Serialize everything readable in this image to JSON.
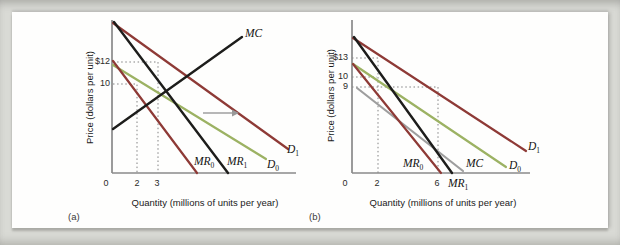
{
  "colors": {
    "maroon": "#8e3a36",
    "green": "#9cb263",
    "black": "#1d1d1b",
    "gray": "#9e9e9e",
    "axis": "#8a8a8a",
    "dotted": "#828282",
    "arrow": "#999999",
    "background": "#d9dad5",
    "card": "#fefefd"
  },
  "panels": [
    {
      "id": "a",
      "tag": "(a)",
      "ylabel": "Price (dollars per unit)",
      "xlabel": "Quantity (millions of units per year)",
      "yticks": [
        {
          "label": "$12"
        },
        {
          "label": "10"
        }
      ],
      "xticks": [
        {
          "label": "0"
        },
        {
          "label": "2"
        },
        {
          "label": "3"
        }
      ],
      "curve_labels": [
        {
          "base": "MC",
          "sub": ""
        },
        {
          "base": "MR",
          "sub": "0"
        },
        {
          "base": "MR",
          "sub": "1"
        },
        {
          "base": "D",
          "sub": "0"
        },
        {
          "base": "D",
          "sub": "1"
        }
      ],
      "geometry": {
        "y_axis": [
          112,
          20,
          112,
          173
        ],
        "x_axis": [
          112,
          173,
          296,
          173
        ],
        "curves": [
          {
            "name": "D0",
            "color": "green",
            "w": 2.2,
            "x1": 113,
            "y1": 65,
            "x2": 266,
            "y2": 159
          },
          {
            "name": "MR0",
            "color": "maroon",
            "w": 2.2,
            "x1": 113,
            "y1": 61,
            "x2": 197,
            "y2": 173
          },
          {
            "name": "D1",
            "color": "maroon",
            "w": 2.2,
            "x1": 113,
            "y1": 23,
            "x2": 288,
            "y2": 149
          },
          {
            "name": "MC",
            "color": "black",
            "w": 2.4,
            "x1": 113,
            "y1": 129,
            "x2": 242,
            "y2": 37
          },
          {
            "name": "MR1",
            "color": "black",
            "w": 2.4,
            "x1": 114,
            "y1": 22,
            "x2": 228,
            "y2": 173
          }
        ],
        "dotted": [
          {
            "name": "price-12-quantity-3",
            "pts": [
              [
                113,
                62
              ],
              [
                158,
                62
              ],
              [
                158,
                173
              ]
            ]
          },
          {
            "name": "price-10-quantity-2",
            "pts": [
              [
                113,
                84
              ],
              [
                137,
                84
              ],
              [
                137,
                173
              ]
            ]
          }
        ],
        "arrow": {
          "x1": 203,
          "y1": 113,
          "x2": 239,
          "y2": 113
        }
      }
    },
    {
      "id": "b",
      "tag": "(b)",
      "ylabel": "Price (dollars per unit)",
      "xlabel": "Quantity (millions of units per year)",
      "yticks": [
        {
          "label": "$13"
        },
        {
          "label": "10"
        },
        {
          "label": "9"
        }
      ],
      "xticks": [
        {
          "label": "0"
        },
        {
          "label": "2"
        },
        {
          "label": "6"
        }
      ],
      "curve_labels": [
        {
          "base": "MR",
          "sub": "0"
        },
        {
          "base": "MC",
          "sub": ""
        },
        {
          "base": "MR",
          "sub": "1"
        },
        {
          "base": "D",
          "sub": "0"
        },
        {
          "base": "D",
          "sub": "1"
        }
      ],
      "geometry": {
        "y_axis": [
          352,
          20,
          352,
          173
        ],
        "x_axis": [
          352,
          173,
          530,
          173
        ],
        "curves": [
          {
            "name": "MC",
            "color": "gray",
            "w": 2.2,
            "x1": 357,
            "y1": 88,
            "x2": 463,
            "y2": 171
          },
          {
            "name": "D0",
            "color": "green",
            "w": 2.2,
            "x1": 353,
            "y1": 64,
            "x2": 506,
            "y2": 167
          },
          {
            "name": "MR0",
            "color": "maroon",
            "w": 2.2,
            "x1": 353,
            "y1": 64,
            "x2": 441,
            "y2": 173
          },
          {
            "name": "D1",
            "color": "maroon",
            "w": 2.2,
            "x1": 353,
            "y1": 38,
            "x2": 526,
            "y2": 151
          },
          {
            "name": "MR1",
            "color": "black",
            "w": 2.4,
            "x1": 354,
            "y1": 37,
            "x2": 452,
            "y2": 173
          }
        ],
        "dotted": [
          {
            "name": "price-13-quantity-2",
            "pts": [
              [
                352,
                58
              ],
              [
                378,
                58
              ],
              [
                378,
                173
              ]
            ]
          },
          {
            "name": "price-10",
            "pts": [
              [
                352,
                77
              ],
              [
                377,
                77
              ]
            ]
          },
          {
            "name": "price-9-quantity-6",
            "pts": [
              [
                352,
                87
              ],
              [
                438,
                87
              ],
              [
                438,
                173
              ]
            ]
          }
        ]
      }
    }
  ],
  "chart_data": [
    {
      "type": "line",
      "panel": "(a)",
      "xlabel": "Quantity (millions of units per year)",
      "ylabel": "Price (dollars per unit)",
      "xticks": [
        0,
        2,
        3
      ],
      "yticks": [
        "$12",
        "10"
      ],
      "series": [
        {
          "name": "D0",
          "role": "initial demand",
          "color": "#9cb263",
          "slope": "downward"
        },
        {
          "name": "MR0",
          "role": "initial marginal revenue",
          "color": "#8e3a36",
          "slope": "downward"
        },
        {
          "name": "D1",
          "role": "new demand after rightward shift",
          "color": "#8e3a36",
          "slope": "downward"
        },
        {
          "name": "MR1",
          "role": "new marginal revenue",
          "color": "#1d1d1b",
          "slope": "downward"
        },
        {
          "name": "MC",
          "role": "marginal cost",
          "color": "#1d1d1b",
          "slope": "upward"
        }
      ],
      "marked_points": [
        {
          "quantity": 2,
          "price": 10,
          "on": "D0"
        },
        {
          "quantity": 3,
          "price": 12,
          "on": "D1"
        }
      ],
      "annotations": [
        "gray rightward arrow showing demand shift from D0 to D1"
      ],
      "grid": false
    },
    {
      "type": "line",
      "panel": "(b)",
      "xlabel": "Quantity (millions of units per year)",
      "ylabel": "Price (dollars per unit)",
      "xticks": [
        0,
        2,
        6
      ],
      "yticks": [
        "$13",
        "10",
        "9"
      ],
      "series": [
        {
          "name": "D0",
          "role": "initial demand",
          "color": "#9cb263",
          "slope": "downward"
        },
        {
          "name": "MR0",
          "role": "initial marginal revenue",
          "color": "#8e3a36",
          "slope": "downward"
        },
        {
          "name": "D1",
          "role": "new demand after rightward shift",
          "color": "#8e3a36",
          "slope": "downward"
        },
        {
          "name": "MR1",
          "role": "new marginal revenue",
          "color": "#1d1d1b",
          "slope": "downward"
        },
        {
          "name": "MC",
          "role": "marginal cost",
          "color": "#9e9e9e",
          "slope": "downward"
        }
      ],
      "marked_points": [
        {
          "quantity": 2,
          "price": 13,
          "on": "D1"
        },
        {
          "quantity": 2,
          "price": 10,
          "on": "D0"
        },
        {
          "quantity": 6,
          "price": 9,
          "on": "D1"
        }
      ],
      "grid": false
    }
  ]
}
